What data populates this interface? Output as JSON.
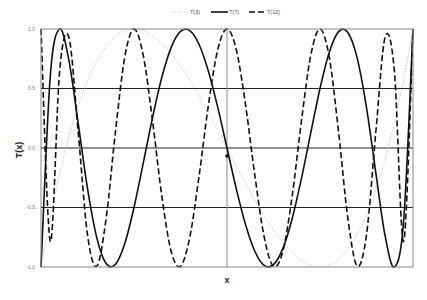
{
  "chart_data": {
    "type": "line",
    "title": "",
    "xlabel": "x",
    "ylabel": "T(x)",
    "xlim": [
      -1,
      1
    ],
    "ylim": [
      -1,
      1
    ],
    "yticks": [
      1.0,
      0.5,
      0.0,
      -0.5,
      -1.0
    ],
    "ytick_labels": [
      "1.0",
      "0.5",
      "0.0",
      "-0.5",
      "-1.0"
    ],
    "xticks_visible": false,
    "grid": {
      "horizontal_at": [
        0.5,
        0.0,
        -0.5
      ],
      "vertical_at": [
        0.0
      ]
    },
    "legend": {
      "position": "top-center",
      "entries": [
        "T(3)",
        "T(7)",
        "T(12)"
      ]
    },
    "x": [
      -1,
      -0.95,
      -0.9,
      -0.85,
      -0.8,
      -0.75,
      -0.7,
      -0.65,
      -0.6,
      -0.55,
      -0.5,
      -0.45,
      -0.4,
      -0.35,
      -0.3,
      -0.25,
      -0.2,
      -0.15,
      -0.1,
      -0.05,
      0,
      0.05,
      0.1,
      0.15,
      0.2,
      0.25,
      0.3,
      0.35,
      0.4,
      0.45,
      0.5,
      0.55,
      0.6,
      0.65,
      0.7,
      0.75,
      0.8,
      0.85,
      0.9,
      0.95,
      1
    ],
    "series": [
      {
        "name": "T(3)",
        "style": "dotted",
        "color": "#bbbbbb",
        "values": [
          -1,
          -0.5795,
          -0.216,
          0.0935,
          0.352,
          0.5625,
          0.728,
          0.8515,
          0.936,
          0.9845,
          1,
          0.9855,
          0.944,
          0.8785,
          0.792,
          0.6875,
          0.568,
          0.4365,
          0.296,
          0.1495,
          0,
          -0.1495,
          -0.296,
          -0.4365,
          -0.568,
          -0.6875,
          -0.792,
          -0.8785,
          -0.944,
          -0.9855,
          -1,
          -0.9845,
          -0.936,
          -0.8515,
          -0.728,
          -0.5625,
          -0.352,
          -0.0935,
          0.216,
          0.5795,
          1
        ]
      },
      {
        "name": "T(7)",
        "style": "solid",
        "color": "#111111",
        "values": [
          -1,
          0.606,
          1.0,
          0.737,
          0.206,
          -0.34,
          -0.755,
          -0.971,
          -0.978,
          -0.805,
          -0.5,
          -0.125,
          0.258,
          0.596,
          0.846,
          0.98,
          0.987,
          0.87,
          0.645,
          0.343,
          0,
          -0.343,
          -0.645,
          -0.87,
          -0.987,
          -0.98,
          -0.846,
          -0.596,
          -0.258,
          0.125,
          0.5,
          0.805,
          0.978,
          0.971,
          0.755,
          0.34,
          -0.206,
          -0.737,
          -1.0,
          -0.606,
          1
        ]
      },
      {
        "name": "T(12)",
        "style": "dashed",
        "color": "#111111",
        "values": [
          1,
          -0.785,
          0.644,
          0.931,
          0.132,
          -0.73,
          -0.993,
          -0.594,
          0.132,
          0.761,
          1,
          0.776,
          0.224,
          -0.409,
          -0.87,
          -0.994,
          -0.749,
          -0.234,
          0.36,
          0.825,
          1,
          0.825,
          0.36,
          -0.234,
          -0.749,
          -0.994,
          -0.87,
          -0.409,
          0.224,
          0.776,
          1,
          0.761,
          0.132,
          -0.594,
          -0.993,
          -0.73,
          0.132,
          0.931,
          0.644,
          -0.785,
          1
        ]
      }
    ]
  }
}
